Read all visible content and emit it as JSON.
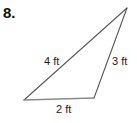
{
  "problem": {
    "number_label": "8."
  },
  "figure": {
    "type": "triangle",
    "name": "scalene-triangle",
    "unit": "ft",
    "vertices": {
      "apex": {
        "x": 127,
        "y": 8
      },
      "bottom_left": {
        "x": 24,
        "y": 100
      },
      "bottom_right": {
        "x": 94,
        "y": 98
      }
    },
    "sides": [
      {
        "id": "side-a",
        "label": "4 ft",
        "value": 4,
        "position": "left"
      },
      {
        "id": "side-b",
        "label": "3 ft",
        "value": 3,
        "position": "right"
      },
      {
        "id": "side-c",
        "label": "2 ft",
        "value": 2,
        "position": "bottom"
      }
    ],
    "colors": {
      "stroke_diagonal": "#58585a",
      "stroke_base": "#8a8a8c",
      "text": "#1a1a1a",
      "background": "#ffffff"
    }
  }
}
